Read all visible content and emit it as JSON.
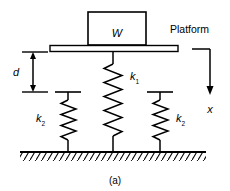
{
  "figure": {
    "caption": "(a)",
    "type": "free-body spring-mass schematic"
  },
  "labels": {
    "weight": "W",
    "platform": "Platform",
    "gap": "d",
    "displacement": "x",
    "spring_primary": "k",
    "spring_primary_sub": "1",
    "spring_secondary_left": "k",
    "spring_secondary_left_sub": "2",
    "spring_secondary_right": "k",
    "spring_secondary_right_sub": "2"
  },
  "colors": {
    "stroke": "#000000",
    "background": "#ffffff",
    "fill": "#ffffff"
  },
  "geometry": {
    "platform_y": 49,
    "ground_y": 152,
    "gap_top_y": 52,
    "gap_bottom_y": 92,
    "mass_box": {
      "x": 88,
      "y": 12,
      "width": 58,
      "height": 33
    },
    "spring_k1_x": 113,
    "spring_k2_left_x": 68,
    "spring_k2_right_x": 160
  }
}
